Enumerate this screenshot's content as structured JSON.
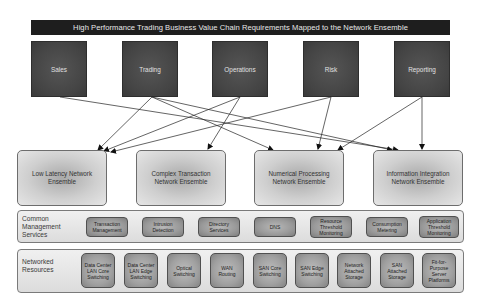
{
  "title": "High Performance Trading Business Value Chain Requirements Mapped to the Network Ensemble",
  "business_functions": [
    {
      "id": "sales",
      "label": "Sales"
    },
    {
      "id": "trading",
      "label": "Trading"
    },
    {
      "id": "operations",
      "label": "Operations"
    },
    {
      "id": "risk",
      "label": "Risk"
    },
    {
      "id": "reporting",
      "label": "Reporting"
    }
  ],
  "ensembles": [
    {
      "id": "low-latency",
      "label": "Low Latency Network Ensemble"
    },
    {
      "id": "complex-transaction",
      "label": "Complex Transaction Network Ensemble"
    },
    {
      "id": "numerical-processing",
      "label": "Numerical Processing Network Ensemble"
    },
    {
      "id": "information-integration",
      "label": "Information Integration Network Ensemble"
    }
  ],
  "connections": [
    {
      "from": "sales",
      "to": "information-integration"
    },
    {
      "from": "trading",
      "to": "low-latency"
    },
    {
      "from": "trading",
      "to": "numerical-processing"
    },
    {
      "from": "trading",
      "to": "information-integration"
    },
    {
      "from": "operations",
      "to": "low-latency"
    },
    {
      "from": "operations",
      "to": "complex-transaction"
    },
    {
      "from": "risk",
      "to": "low-latency"
    },
    {
      "from": "risk",
      "to": "numerical-processing"
    },
    {
      "from": "reporting",
      "to": "numerical-processing"
    },
    {
      "from": "reporting",
      "to": "information-integration"
    }
  ],
  "management_services": {
    "label": "Common Management Services",
    "items": [
      "Transaction Management",
      "Intrusion Detection",
      "Directory Services",
      "DNS",
      "Resource Threshold Monitoring",
      "Consumption Metering",
      "Application Threshold Monitoring"
    ]
  },
  "networked_resources": {
    "label": "Networked Resources",
    "items": [
      "Data Center LAN Core Switching",
      "Data Center LAN Edge Switching",
      "Optical Switching",
      "WAN Routing",
      "SAN Core Switching",
      "SAN Edge Switching",
      "Network Attached Storage",
      "SAN Attached Storage",
      "Fit-for-Purpose Server Platforms"
    ]
  }
}
